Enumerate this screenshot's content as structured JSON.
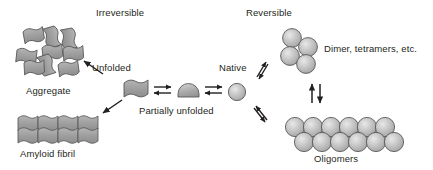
{
  "diagram": {
    "background_color": "#ffffff",
    "text_color": "#231f20",
    "shape_fill": "#9a9a9a",
    "shape_stroke": "#58595b",
    "arrow_color": "#231f20",
    "width": 433,
    "height": 170
  },
  "headings": {
    "irreversible": "Irreversible",
    "reversible": "Reversible"
  },
  "labels": {
    "aggregate": "Aggregate",
    "amyloid_fibril": "Amyloid fibril",
    "unfolded": "Unfolded",
    "partially_unfolded": "Partially unfolded",
    "native": "Native",
    "dimer_tetramers": "Dimer, tetramers, etc.",
    "oligomers": "Oligomers"
  },
  "species": [
    {
      "id": "aggregate",
      "label": "Aggregate",
      "icon": "disordered-ribbon-cluster-icon",
      "element_count": 9,
      "arrangement": "random",
      "region": "top-left"
    },
    {
      "id": "amyloid-fibril",
      "label": "Amyloid fibril",
      "icon": "ordered-ribbon-stack-icon",
      "element_count": 8,
      "arrangement": "ordered-grid-4x2",
      "region": "bottom-left"
    },
    {
      "id": "unfolded",
      "label": "Unfolded",
      "icon": "wavy-ribbon-icon",
      "element_count": 1,
      "arrangement": "single",
      "region": "center-left"
    },
    {
      "id": "partially-unfolded",
      "label": "Partially unfolded",
      "icon": "dome-shape-icon",
      "element_count": 1,
      "arrangement": "single",
      "region": "center"
    },
    {
      "id": "native",
      "label": "Native",
      "icon": "sphere-icon",
      "element_count": 1,
      "arrangement": "single",
      "region": "center-right"
    },
    {
      "id": "dimer-tetramers",
      "label": "Dimer, tetramers, etc.",
      "icon": "sphere-cluster-icon",
      "element_count": 4,
      "arrangement": "diamond-cluster",
      "region": "top-right"
    },
    {
      "id": "oligomers",
      "label": "Oligomers",
      "icon": "sphere-double-row-icon",
      "element_count": 12,
      "arrangement": "two-rows-of-six",
      "region": "bottom-right"
    }
  ],
  "arrows": [
    {
      "id": "unfolded-to-aggregate",
      "type": "single",
      "direction": "up-left",
      "reversibility": "irreversible",
      "from": "unfolded",
      "to": "aggregate"
    },
    {
      "id": "unfolded-to-amyloid-fibril",
      "type": "single",
      "direction": "down-left",
      "reversibility": "irreversible",
      "from": "unfolded",
      "to": "amyloid-fibril"
    },
    {
      "id": "unfolded-partially-unfolded",
      "type": "double-horizontal",
      "direction": "bidirectional",
      "reversibility": "reversible",
      "from": "unfolded",
      "to": "partially-unfolded"
    },
    {
      "id": "partially-unfolded-native",
      "type": "double-horizontal",
      "direction": "bidirectional",
      "reversibility": "reversible",
      "from": "partially-unfolded",
      "to": "native"
    },
    {
      "id": "native-to-dimer",
      "type": "double-diagonal",
      "direction": "up-right",
      "reversibility": "reversible",
      "from": "native",
      "to": "dimer-tetramers"
    },
    {
      "id": "native-to-oligomers",
      "type": "double-diagonal",
      "direction": "down-right",
      "reversibility": "reversible",
      "from": "native",
      "to": "oligomers"
    },
    {
      "id": "dimer-to-oligomers",
      "type": "double-vertical",
      "direction": "bidirectional",
      "reversibility": "reversible",
      "from": "dimer-tetramers",
      "to": "oligomers"
    }
  ]
}
